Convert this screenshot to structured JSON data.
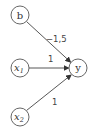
{
  "diagram": {
    "type": "perceptron",
    "nodes": [
      {
        "id": "b",
        "label": "b",
        "sub": "",
        "cx": 20,
        "cy": 15
      },
      {
        "id": "x1",
        "label": "x",
        "sub": "1",
        "cx": 20,
        "cy": 68
      },
      {
        "id": "x2",
        "label": "x",
        "sub": "2",
        "cx": 20,
        "cy": 117
      },
      {
        "id": "y",
        "label": "y",
        "sub": "",
        "cx": 78,
        "cy": 68
      }
    ],
    "edges": [
      {
        "from": "b",
        "to": "y",
        "weight": "−1,5"
      },
      {
        "from": "x1",
        "to": "y",
        "weight": "1"
      },
      {
        "from": "x2",
        "to": "y",
        "weight": "1"
      }
    ]
  }
}
